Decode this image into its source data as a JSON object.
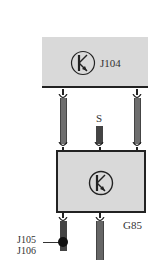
{
  "diagram": {
    "top_module": {
      "label": "J104",
      "symbol": "transistor-npn-icon"
    },
    "bottom_module": {
      "label": "G85",
      "symbol": "transistor-npn-icon"
    },
    "signal": {
      "label": "S"
    },
    "junction": {
      "labels": [
        "J105",
        "J106"
      ]
    }
  },
  "colors": {
    "module_fill": "#d9d9d9",
    "wire": "#666666",
    "wire_dark": "#444444",
    "outline": "#222222"
  }
}
